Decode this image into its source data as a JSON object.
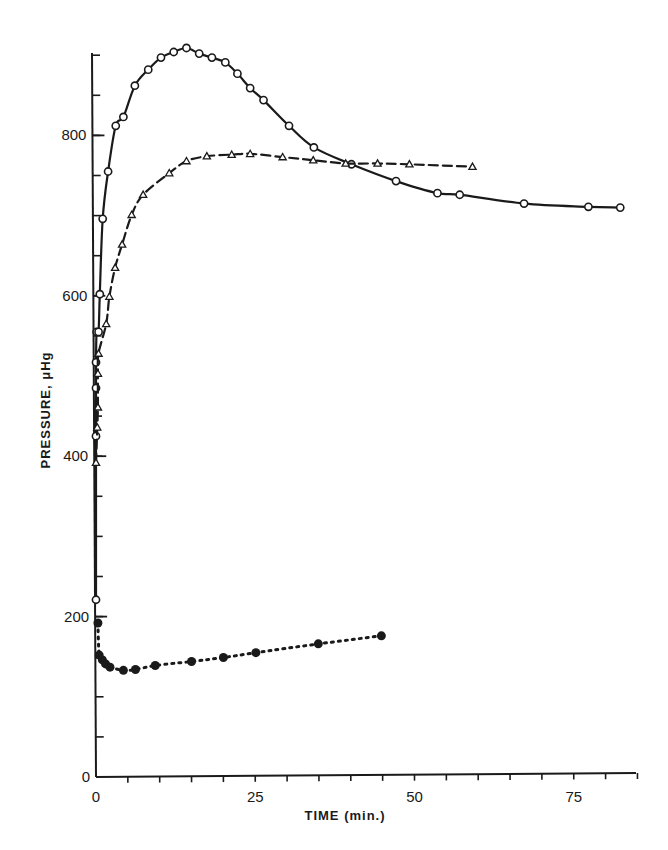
{
  "chart_data": {
    "type": "line",
    "title": "",
    "xlabel": "TIME (min.)",
    "ylabel": "PRESSURE, μHg",
    "xlim": [
      0,
      85
    ],
    "ylim": [
      0,
      900
    ],
    "x_ticks": [
      0,
      25,
      50,
      75
    ],
    "x_minor_step": 5,
    "y_ticks": [
      0,
      200,
      400,
      600,
      800
    ],
    "y_minor_step": 50,
    "grid": false,
    "legend": null,
    "series": [
      {
        "name": "open-circles (solid line)",
        "marker": "open-circle",
        "line": "solid",
        "color": "#1a1a1a",
        "x": [
          0.0,
          0.0,
          0.0,
          0.0,
          0.1,
          0.4,
          0.6,
          1.05,
          1.9,
          3.1,
          4.3,
          6.1,
          8.2,
          10.2,
          12.2,
          14.2,
          16.2,
          18.2,
          20.3,
          22.2,
          24.2,
          26.3,
          30.3,
          34.2,
          40.1,
          47.1,
          53.6,
          57.1,
          67.2,
          77.3,
          82.3
        ],
        "y": [
          221,
          425,
          485,
          517,
          555,
          555,
          602,
          696,
          755,
          812,
          823,
          862,
          882,
          897,
          904,
          909,
          902,
          897,
          891,
          877,
          859,
          844,
          812,
          785,
          764,
          743,
          728,
          726,
          715,
          711,
          710
        ]
      },
      {
        "name": "open-triangles (dashed line)",
        "marker": "open-triangle",
        "line": "dashed",
        "color": "#1a1a1a",
        "x": [
          0.0,
          0.2,
          0.3,
          0.3,
          0.4,
          1.6,
          2.1,
          3.0,
          4.1,
          5.6,
          7.4,
          11.5,
          14.2,
          17.4,
          21.3,
          24.2,
          29.3,
          34.1,
          39.2,
          44.2,
          49.2,
          59.1
        ],
        "y": [
          392,
          436,
          461,
          503,
          528,
          565,
          599,
          635,
          664,
          701,
          726,
          753,
          768,
          774,
          776,
          777,
          773,
          769,
          765,
          765,
          764,
          761
        ]
      },
      {
        "name": "filled-circles (dotted line)",
        "marker": "filled-circle",
        "line": "dotted",
        "color": "#1a1a1a",
        "x": [
          0.3,
          0.5,
          1.0,
          1.5,
          2.2,
          4.3,
          6.2,
          9.3,
          15.0,
          20.0,
          25.1,
          34.9,
          44.8
        ],
        "y": [
          192,
          152,
          146,
          141,
          137,
          133,
          134,
          139,
          144,
          149,
          155,
          166,
          176
        ]
      }
    ]
  },
  "axes": {
    "x_tick_labels": [
      "0",
      "25",
      "50",
      "75"
    ],
    "y_tick_labels": [
      "0",
      "200",
      "400",
      "600",
      "800"
    ],
    "x_title": "TIME (min.)",
    "y_title": "PRESSURE,  μHg"
  }
}
